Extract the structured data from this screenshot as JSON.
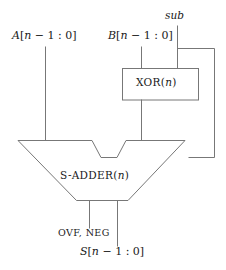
{
  "diagram": {
    "type": "logic-block-diagram",
    "stroke_color": "#777777",
    "text_color": "#1a1a1a",
    "background": "#ffffff",
    "inputs": [
      {
        "id": "A",
        "label": "A[n − 1 : 0]",
        "x": 45,
        "y": 30
      },
      {
        "id": "B",
        "label": "B[n − 1 : 0]",
        "x": 141,
        "y": 30
      },
      {
        "id": "sub",
        "label": "sub",
        "x": 177,
        "y": 14
      }
    ],
    "blocks": [
      {
        "id": "xor",
        "label": "XOR(n)",
        "label_text": "XOR",
        "label_arg": "(n)",
        "shape": "rect",
        "x": 122,
        "y": 68,
        "width": 76,
        "height": 32
      },
      {
        "id": "adder",
        "label": "S-ADDER(n)",
        "label_text": "S-ADDER",
        "label_arg": "(n)",
        "shape": "alu-trapezoid",
        "x": 18,
        "y": 140,
        "width": 167,
        "height": 60
      }
    ],
    "outputs": [
      {
        "id": "flags",
        "label": "OVF, NEG",
        "x": 89,
        "y": 232
      },
      {
        "id": "sum",
        "label": "S[n − 1 : 0]",
        "x": 117,
        "y": 250
      }
    ],
    "wires": [
      {
        "id": "a-bus",
        "from": "A",
        "to": "adder-left-input"
      },
      {
        "id": "b-bus",
        "from": "B",
        "to": "xor-input-left"
      },
      {
        "id": "sub-bus",
        "from": "sub",
        "to": "xor-input-right"
      },
      {
        "id": "sub-branch",
        "from": "sub",
        "to": "adder-carry-in"
      },
      {
        "id": "xor-out-bus",
        "from": "xor",
        "to": "adder-right-input"
      },
      {
        "id": "flags-out",
        "from": "adder",
        "to": "flags"
      },
      {
        "id": "sum-out",
        "from": "adder",
        "to": "sum"
      }
    ]
  }
}
